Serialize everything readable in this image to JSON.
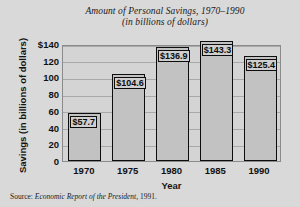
{
  "chart_data": {
    "type": "bar",
    "title": "Amount of Personal Savings, 1970–1990",
    "subtitle": "(in billions of dollars)",
    "xlabel": "Year",
    "ylabel": "Savings (in billions of dollars)",
    "categories": [
      "1970",
      "1975",
      "1980",
      "1985",
      "1990"
    ],
    "values": [
      57.7,
      104.6,
      136.9,
      143.3,
      125.4
    ],
    "value_labels": [
      "$57.7",
      "$104.6",
      "$136.9",
      "$143.3",
      "$125.4"
    ],
    "ylim": [
      0,
      140
    ],
    "ytick_values": [
      0,
      20,
      40,
      60,
      80,
      100,
      120,
      140
    ],
    "ytick_labels": [
      "0",
      "20",
      "40",
      "60",
      "80",
      "100",
      "120",
      "$140"
    ],
    "grid": true,
    "legend": false,
    "source": "Source: Economic Report of the President, 1991.",
    "source_prefix": "Source:",
    "source_italic": "Economic Report of the President,",
    "source_year": "1991.",
    "colors": {
      "background": "#d9d9d9",
      "plot_background": "#d4d4d4",
      "bar_fill": "#c2c2c2",
      "bar_edge": "#0d0d0d",
      "gridline": "#a9a9a9",
      "frame": "#8a8a8a",
      "text": "#111111",
      "label_box_fill": "#cfcfcf"
    }
  }
}
